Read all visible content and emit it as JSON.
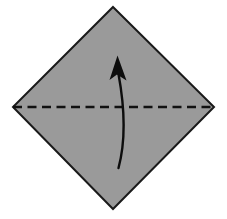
{
  "figure": {
    "kind": "origami-fold-diagram",
    "canvas": {
      "width": 227,
      "height": 219,
      "background": "#ffffff"
    }
  },
  "shape": {
    "name": "square-rotated-45-diamond",
    "fill": "#9a9a9a",
    "stroke": "#1a1a1a",
    "stroke_width": 2,
    "vertices": [
      {
        "label": "top",
        "x": 113,
        "y": 7
      },
      {
        "label": "right",
        "x": 214,
        "y": 107
      },
      {
        "label": "bottom",
        "x": 113,
        "y": 209
      },
      {
        "label": "left",
        "x": 13,
        "y": 107
      }
    ],
    "points_attr": "113,7 214,107 113,209 13,107"
  },
  "fold_line": {
    "name": "horizontal-fold-crease",
    "style": "dashed",
    "stroke": "#111111",
    "stroke_width": 2.6,
    "dash_array": "9 5.5",
    "x1": 13,
    "y1": 107,
    "x2": 214,
    "y2": 107
  },
  "fold_arrow": {
    "name": "curved-fold-arrow",
    "direction": "upward",
    "stroke": "#0d0d0d",
    "stroke_width": 2.4,
    "curve_path": "M 118.5 168 C 125.5 142 125.5 112 118.5 74",
    "head": {
      "fill": "#0d0d0d",
      "points_attr": "117.5,55.5 126.5,80.5 117.0,74.5 109.5,80.0"
    }
  }
}
